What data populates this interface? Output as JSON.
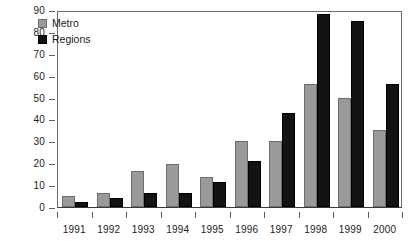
{
  "chart_data": {
    "type": "bar",
    "title": "",
    "subtitle": "",
    "xlabel": "",
    "ylabel": "",
    "categories": [
      "1991",
      "1992",
      "1993",
      "1994",
      "1995",
      "1996",
      "1997",
      "1998",
      "1999",
      "2000"
    ],
    "series": [
      {
        "name": "Metro",
        "color": "#9a9a9a",
        "values": [
          5,
          6.5,
          16.5,
          19.5,
          13.5,
          30,
          30,
          56,
          50,
          35
        ]
      },
      {
        "name": "Regions",
        "color": "#131313",
        "values": [
          2.5,
          4,
          6.5,
          6.5,
          11.5,
          21,
          43,
          88,
          85,
          56
        ]
      }
    ],
    "ylim": [
      0,
      90
    ],
    "ytick_step": 10,
    "yticks": [
      0,
      10,
      20,
      30,
      40,
      50,
      60,
      70,
      80,
      90
    ],
    "ytick_labels": [
      "0",
      "10",
      "20",
      "30",
      "40",
      "50",
      "60",
      "70",
      "80",
      "90"
    ],
    "grid": false,
    "legend_position": "top-left",
    "legend": [
      {
        "label": "Metro",
        "swatch": "metro"
      },
      {
        "label": "Regions",
        "swatch": "regions"
      }
    ]
  }
}
